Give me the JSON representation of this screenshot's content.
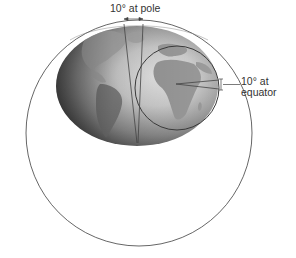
{
  "diagram": {
    "labels": {
      "pole": "10° at pole",
      "equator_line1": "10° at",
      "equator_line2": "equator"
    },
    "elements": {
      "outer_circle": {
        "cx": 139,
        "cy": 133,
        "r": 113
      },
      "earth": {
        "cx": 137,
        "cy": 86,
        "rx": 81,
        "ry": 60
      },
      "equator_circle": {
        "cx": 177,
        "cy": 88,
        "r": 42
      }
    },
    "colors": {
      "line": "#555555",
      "earth_dark": "#3a3a3a",
      "earth_light": "#d8d8d8",
      "land": "#9a9a9a",
      "text": "#333333"
    }
  }
}
